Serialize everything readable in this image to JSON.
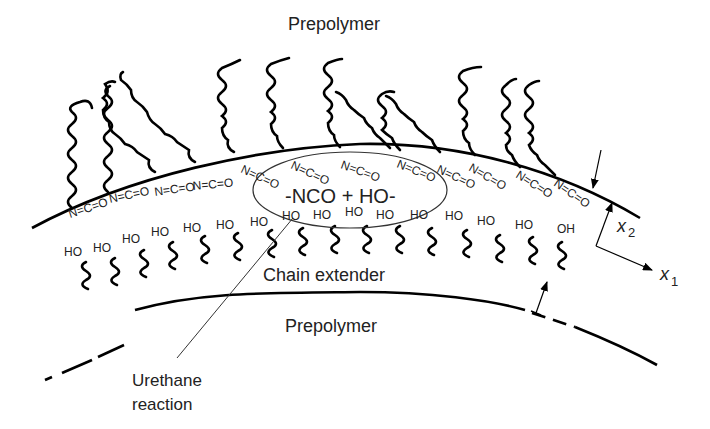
{
  "labels": {
    "top_prepolymer": "Prepolymer",
    "chain_extender": "Chain extender",
    "bottom_prepolymer": "Prepolymer",
    "reaction": "-NCO + HO-",
    "callout_line1": "Urethane",
    "callout_line2": "reaction",
    "axis_x1": "x",
    "axis_x1_sub": "1",
    "axis_x2": "x",
    "axis_x2_sub": "2"
  },
  "nco_groups": [
    {
      "text": "N=C=O",
      "x": 70,
      "y": 218,
      "rot": -18
    },
    {
      "text": "N=C=O",
      "x": 110,
      "y": 203,
      "rot": -12
    },
    {
      "text": "N=C=O",
      "x": 155,
      "y": 196,
      "rot": -8
    },
    {
      "text": "N=C=O",
      "x": 193,
      "y": 190,
      "rot": -5
    },
    {
      "text": "N=C=O",
      "x": 240,
      "y": 172,
      "rot": 25
    },
    {
      "text": "N=C=O",
      "x": 290,
      "y": 168,
      "rot": 25
    },
    {
      "text": "N=C=O",
      "x": 340,
      "y": 168,
      "rot": 20
    },
    {
      "text": "N=C=O",
      "x": 396,
      "y": 167,
      "rot": 22
    },
    {
      "text": "N=C=O",
      "x": 436,
      "y": 172,
      "rot": 25
    },
    {
      "text": "N=C=O",
      "x": 468,
      "y": 170,
      "rot": 30
    },
    {
      "text": "N=C=O",
      "x": 515,
      "y": 177,
      "rot": 32
    },
    {
      "text": "N=C=O",
      "x": 553,
      "y": 185,
      "rot": 35
    }
  ],
  "hydroxyl_groups": [
    {
      "text": "HO",
      "x": 64,
      "y": 256
    },
    {
      "text": "HO",
      "x": 93,
      "y": 252
    },
    {
      "text": "HO",
      "x": 122,
      "y": 243
    },
    {
      "text": "HO",
      "x": 151,
      "y": 236
    },
    {
      "text": "HO",
      "x": 183,
      "y": 232
    },
    {
      "text": "HO",
      "x": 216,
      "y": 229
    },
    {
      "text": "HO",
      "x": 250,
      "y": 226
    },
    {
      "text": "HO",
      "x": 282,
      "y": 220
    },
    {
      "text": "HO",
      "x": 313,
      "y": 219
    },
    {
      "text": "HO",
      "x": 345,
      "y": 216
    },
    {
      "text": "HO",
      "x": 376,
      "y": 219
    },
    {
      "text": "HO",
      "x": 410,
      "y": 219
    },
    {
      "text": "HO",
      "x": 445,
      "y": 220
    },
    {
      "text": "HO",
      "x": 477,
      "y": 225
    },
    {
      "text": "HO",
      "x": 515,
      "y": 229
    },
    {
      "text": "OH",
      "x": 557,
      "y": 233
    }
  ],
  "colors": {
    "ink": "#000000",
    "text": "#222222",
    "background": "#ffffff"
  }
}
